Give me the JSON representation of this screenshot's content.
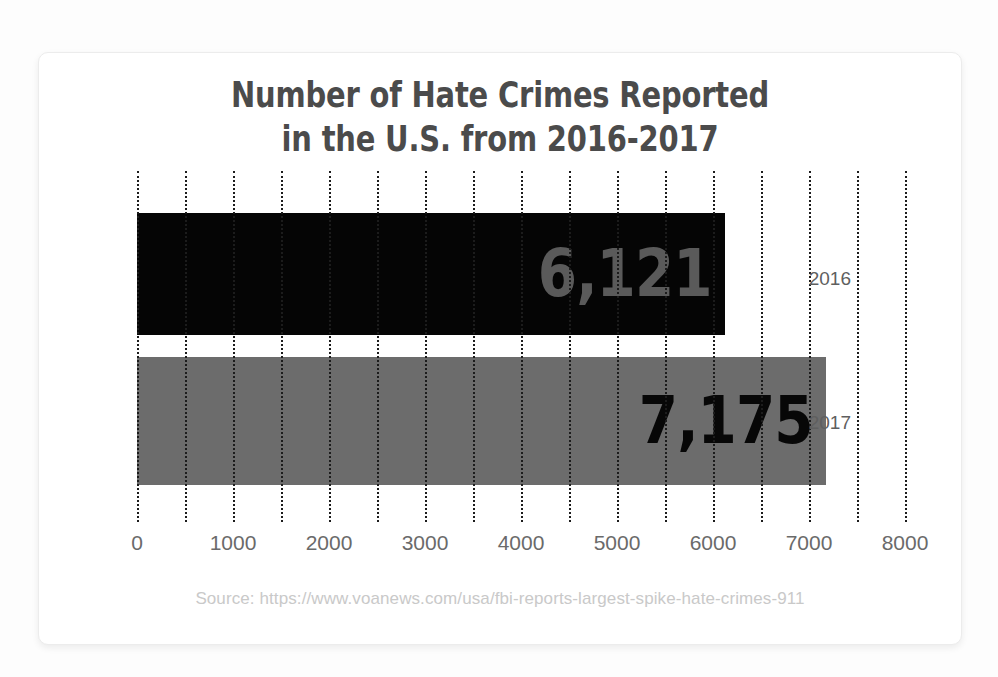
{
  "card": {
    "title": "Number of Hate Crimes Reported\nin the U.S. from 2016-2017",
    "source": "Source: https://www.voanews.com/usa/fbi-reports-largest-spike-hate-crimes-911"
  },
  "colors": {
    "title": "#4b4b4b",
    "bar_2016": "#050505",
    "bar_2017": "#6c6c6c",
    "label_2016": "#5a5a5a",
    "label_2017": "#070707",
    "gridline": "#1c1c1c",
    "tick_text": "#6a6a6a",
    "source_text": "#c9c9c9",
    "card_background": "#ffffff",
    "page_background": "#fdfdfd"
  },
  "chart_data": {
    "type": "bar",
    "orientation": "horizontal",
    "title": "Number of Hate Crimes Reported in the U.S. from 2016-2017",
    "xlabel": "",
    "ylabel": "",
    "categories": [
      "2016",
      "2017"
    ],
    "values": [
      6121,
      7175
    ],
    "value_labels": [
      "6,121",
      "7,175"
    ],
    "bar_colors": [
      "#050505",
      "#6c6c6c"
    ],
    "xlim": [
      0,
      8000
    ],
    "xticks": [
      0,
      1000,
      2000,
      3000,
      4000,
      5000,
      6000,
      7000,
      8000
    ],
    "xtick_labels": [
      "0",
      "1000",
      "2000",
      "3000",
      "4000",
      "5000",
      "6000",
      "7000",
      "8000"
    ],
    "minor_gridline_step": 500,
    "grid": "vertical-dotted",
    "legend": "none",
    "source": "Source: https://www.voanews.com/usa/fbi-reports-largest-spike-hate-crimes-911"
  }
}
